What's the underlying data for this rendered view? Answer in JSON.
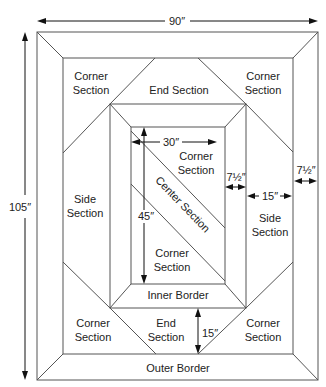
{
  "diagram": {
    "dimensions": {
      "overall_width": "90″",
      "overall_height": "105″",
      "center_width": "30″",
      "center_height": "45″",
      "inner_border_width": "7½″",
      "outer_border_width": "7½″",
      "side_section_width": "15″",
      "end_section_height": "15″"
    },
    "labels": {
      "top_left_corner": [
        "Corner",
        "Section"
      ],
      "top_end": "End Section",
      "top_right_corner": [
        "Corner",
        "Section"
      ],
      "left_side": [
        "Side",
        "Section"
      ],
      "right_side": [
        "Side",
        "Section"
      ],
      "center_upper_corner": [
        "Corner",
        "Section"
      ],
      "center_section": "Center Section",
      "center_lower_corner": [
        "Corner",
        "Section"
      ],
      "inner_border": "Inner Border",
      "bottom_left_corner": [
        "Corner",
        "Section"
      ],
      "bottom_end": [
        "End",
        "Section"
      ],
      "bottom_right_corner": [
        "Corner",
        "Section"
      ],
      "outer_border": "Outer Border"
    },
    "colors": {
      "line": "#555555",
      "arrow": "#111111",
      "text": "#222222",
      "background": "#ffffff"
    }
  }
}
